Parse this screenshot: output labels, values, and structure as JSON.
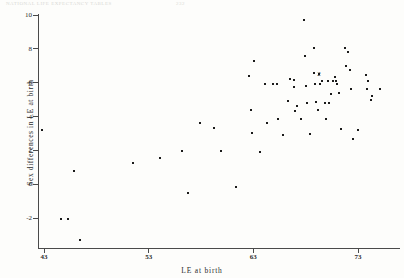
{
  "figure": {
    "bleed_text": "NATIONAL  LIFE  EXPECTANCY  TABLES",
    "bleed_text_right": "232"
  },
  "chart_data": {
    "type": "scatter",
    "title": "",
    "xlabel": "LE at birth",
    "ylabel": "Sex differences in LE at birth",
    "xlim": [
      41,
      77.5
    ],
    "ylim": [
      -3.5,
      10.4
    ],
    "xticks": [
      43,
      53,
      63,
      73
    ],
    "xticklabels": [
      "43",
      "53",
      "63",
      "73"
    ],
    "yticks": [
      -2,
      0,
      2,
      4,
      6,
      8,
      10
    ],
    "yticklabels": [
      "-2",
      "0",
      "2",
      "4",
      "6",
      "8",
      "10"
    ],
    "grid": false,
    "legend": null,
    "marker": "point",
    "marker_color": "#1a1a1a",
    "overlap_labels": [
      {
        "x": 69.3,
        "y": 6.5,
        "label": "2",
        "note": "two coincident points"
      }
    ],
    "points": [
      [
        42.8,
        3.2
      ],
      [
        44.6,
        -2.05
      ],
      [
        45.3,
        -2.05
      ],
      [
        45.9,
        0.75
      ],
      [
        46.4,
        -3.3
      ],
      [
        51.5,
        1.25
      ],
      [
        54.1,
        1.55
      ],
      [
        56.2,
        1.95
      ],
      [
        56.8,
        -0.5
      ],
      [
        57.9,
        3.6
      ],
      [
        59.2,
        3.3
      ],
      [
        59.9,
        1.95
      ],
      [
        61.3,
        -0.15
      ],
      [
        62.6,
        6.4
      ],
      [
        62.8,
        4.4
      ],
      [
        62.9,
        3.05
      ],
      [
        63.1,
        7.3
      ],
      [
        63.6,
        1.9
      ],
      [
        64.1,
        5.95
      ],
      [
        64.3,
        3.6
      ],
      [
        65.3,
        5.95
      ],
      [
        65.4,
        3.85
      ],
      [
        65.8,
        2.9
      ],
      [
        66.3,
        4.9
      ],
      [
        66.9,
        6.15
      ],
      [
        66.9,
        5.75
      ],
      [
        67.0,
        4.35
      ],
      [
        67.2,
        4.6
      ],
      [
        67.6,
        3.85
      ],
      [
        67.8,
        9.7
      ],
      [
        67.9,
        7.55
      ],
      [
        68.0,
        5.8
      ],
      [
        68.1,
        4.8
      ],
      [
        68.4,
        2.95
      ],
      [
        68.8,
        8.05
      ],
      [
        68.8,
        6.6
      ],
      [
        68.9,
        5.95
      ],
      [
        69.0,
        4.85
      ],
      [
        69.2,
        4.4
      ],
      [
        69.3,
        6.5
      ],
      [
        69.6,
        6.1
      ],
      [
        69.8,
        4.8
      ],
      [
        69.9,
        3.85
      ],
      [
        70.1,
        6.1
      ],
      [
        70.2,
        4.8
      ],
      [
        70.4,
        5.35
      ],
      [
        70.8,
        6.35
      ],
      [
        70.9,
        6.1
      ],
      [
        71.0,
        5.95
      ],
      [
        71.2,
        5.4
      ],
      [
        71.4,
        3.25
      ],
      [
        71.8,
        8.05
      ],
      [
        71.9,
        7.0
      ],
      [
        72.0,
        7.8
      ],
      [
        72.2,
        6.75
      ],
      [
        72.3,
        5.6
      ],
      [
        72.5,
        2.65
      ],
      [
        73.0,
        3.2
      ],
      [
        73.8,
        6.45
      ],
      [
        73.9,
        5.6
      ],
      [
        74.0,
        6.1
      ],
      [
        74.2,
        5.0
      ],
      [
        74.3,
        5.2
      ],
      [
        75.1,
        5.6
      ],
      [
        64.9,
        5.95
      ],
      [
        66.5,
        6.2
      ],
      [
        69.4,
        5.95
      ],
      [
        70.6,
        6.1
      ]
    ]
  }
}
